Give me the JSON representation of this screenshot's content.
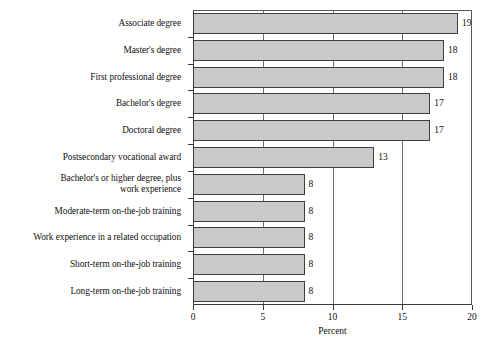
{
  "chart_data": {
    "type": "bar",
    "orientation": "horizontal",
    "title": "",
    "xlabel": "Percent",
    "ylabel": "",
    "xlim": [
      0,
      20
    ],
    "xticks": [
      0,
      5,
      10,
      15,
      20
    ],
    "grid": true,
    "grid_axis": "x",
    "legend": false,
    "value_labels": true,
    "bar_color": "#c9c9c9",
    "bar_edge_color": "#3f3f3f",
    "categories": [
      "Associate degree",
      "Master's degree",
      "First professional degree",
      "Bachelor's degree",
      "Doctoral degree",
      "Postsecondary vocational award",
      "Bachelor's or higher degree, plus work experience",
      "Moderate-term on-the-job training",
      "Work experience in a related occupation",
      "Short-term on-the-job training",
      "Long-term on-the-job training"
    ],
    "category_lines": [
      [
        "Associate degree"
      ],
      [
        "Master's degree"
      ],
      [
        "First professional degree"
      ],
      [
        "Bachelor's degree"
      ],
      [
        "Doctoral degree"
      ],
      [
        "Postsecondary vocational award"
      ],
      [
        "Bachelor's or higher degree, plus",
        "work experience"
      ],
      [
        "Moderate-term on-the-job training"
      ],
      [
        "Work experience in a related occupation"
      ],
      [
        "Short-term on-the-job training"
      ],
      [
        "Long-term on-the-job training"
      ]
    ],
    "values": [
      19,
      18,
      18,
      17,
      17,
      13,
      8,
      8,
      8,
      8,
      8
    ],
    "value_label_text": [
      "19",
      "18",
      "18",
      "17",
      "17",
      "13",
      "8",
      "8",
      "8",
      "8",
      "8"
    ],
    "xtick_labels": [
      "0",
      "5",
      "10",
      "15",
      "20"
    ]
  }
}
